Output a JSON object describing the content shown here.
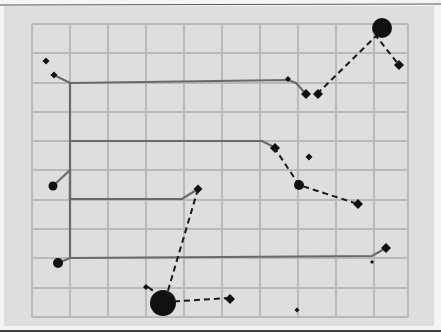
{
  "diagram": {
    "colors": {
      "page": "#f4f4f4",
      "paper": "#dedede",
      "grid": "#b9b9b9",
      "wire": "#6a6a6a",
      "node": "#111111",
      "dashed": "#1a1a1a"
    },
    "grid": {
      "x": [
        32,
        70,
        108,
        146,
        184,
        222,
        260,
        298,
        336,
        374,
        408
      ],
      "y": [
        24,
        53,
        83,
        112,
        141,
        170,
        200,
        229,
        258,
        288,
        317
      ]
    },
    "wires": [
      {
        "id": "wire-top",
        "points": [
          [
            54,
            75
          ],
          [
            70,
            83
          ],
          [
            288,
            80
          ],
          [
            296,
            83
          ],
          [
            306,
            94
          ]
        ]
      },
      {
        "id": "wire-second",
        "points": [
          [
            70,
            141
          ],
          [
            262,
            141
          ],
          [
            274,
            147
          ]
        ]
      },
      {
        "id": "wire-third",
        "points": [
          [
            53,
            186
          ],
          [
            70,
            170
          ],
          [
            70,
            199
          ],
          [
            182,
            199
          ],
          [
            198,
            189
          ]
        ]
      },
      {
        "id": "wire-bottom",
        "points": [
          [
            58,
            263
          ],
          [
            70,
            258
          ],
          [
            372,
            256
          ],
          [
            386,
            248
          ]
        ]
      },
      {
        "id": "wire-trunk",
        "points": [
          [
            70,
            83
          ],
          [
            70,
            258
          ]
        ]
      }
    ],
    "dashed_links": [
      {
        "id": "dash-top",
        "points": [
          [
            317,
            94
          ],
          [
            376,
            36
          ],
          [
            399,
            65
          ]
        ]
      },
      {
        "id": "dash-mid",
        "points": [
          [
            274,
            147
          ],
          [
            299,
            185
          ],
          [
            358,
            204
          ]
        ]
      },
      {
        "id": "dash-low",
        "points": [
          [
            198,
            189
          ],
          [
            167,
            294
          ]
        ]
      },
      {
        "id": "dash-bottom",
        "points": [
          [
            164,
            302
          ],
          [
            230,
            298
          ]
        ]
      },
      {
        "id": "dash-small",
        "points": [
          [
            148,
            287
          ],
          [
            160,
            296
          ]
        ]
      }
    ],
    "nodes": [
      {
        "id": "diamond-1",
        "shape": "diamond",
        "x": 46,
        "y": 61,
        "r": 3.5
      },
      {
        "id": "diamond-2",
        "shape": "diamond",
        "x": 54,
        "y": 75,
        "r": 3.5
      },
      {
        "id": "diamond-3",
        "shape": "diamond",
        "x": 288,
        "y": 79,
        "r": 3
      },
      {
        "id": "diamond-4",
        "shape": "diamond",
        "x": 306,
        "y": 94,
        "r": 5
      },
      {
        "id": "diamond-5",
        "shape": "diamond",
        "x": 318,
        "y": 94,
        "r": 5
      },
      {
        "id": "big-circle-top",
        "shape": "circle",
        "x": 382,
        "y": 28,
        "r": 10
      },
      {
        "id": "diamond-6",
        "shape": "diamond",
        "x": 399,
        "y": 65,
        "r": 5
      },
      {
        "id": "diamond-7",
        "shape": "diamond",
        "x": 275,
        "y": 148,
        "r": 5
      },
      {
        "id": "diamond-8",
        "shape": "diamond",
        "x": 309,
        "y": 157,
        "r": 3.5
      },
      {
        "id": "circle-mid",
        "shape": "circle",
        "x": 299,
        "y": 185,
        "r": 5
      },
      {
        "id": "diamond-9",
        "shape": "diamond",
        "x": 358,
        "y": 204,
        "r": 5
      },
      {
        "id": "circle-left-1",
        "shape": "circle",
        "x": 53,
        "y": 186,
        "r": 4.5
      },
      {
        "id": "diamond-10",
        "shape": "diamond",
        "x": 198,
        "y": 189,
        "r": 4.5
      },
      {
        "id": "circle-left-2",
        "shape": "circle",
        "x": 58,
        "y": 263,
        "r": 5
      },
      {
        "id": "diamond-11",
        "shape": "diamond",
        "x": 386,
        "y": 248,
        "r": 5
      },
      {
        "id": "dot-1",
        "shape": "diamond",
        "x": 372,
        "y": 262,
        "r": 2
      },
      {
        "id": "diamond-12",
        "shape": "diamond",
        "x": 146,
        "y": 287,
        "r": 3
      },
      {
        "id": "big-circle-bottom",
        "shape": "circle",
        "x": 163,
        "y": 303,
        "r": 13
      },
      {
        "id": "diamond-13",
        "shape": "diamond",
        "x": 230,
        "y": 299,
        "r": 5
      },
      {
        "id": "dot-2",
        "shape": "diamond",
        "x": 297,
        "y": 310,
        "r": 2.5
      }
    ]
  }
}
